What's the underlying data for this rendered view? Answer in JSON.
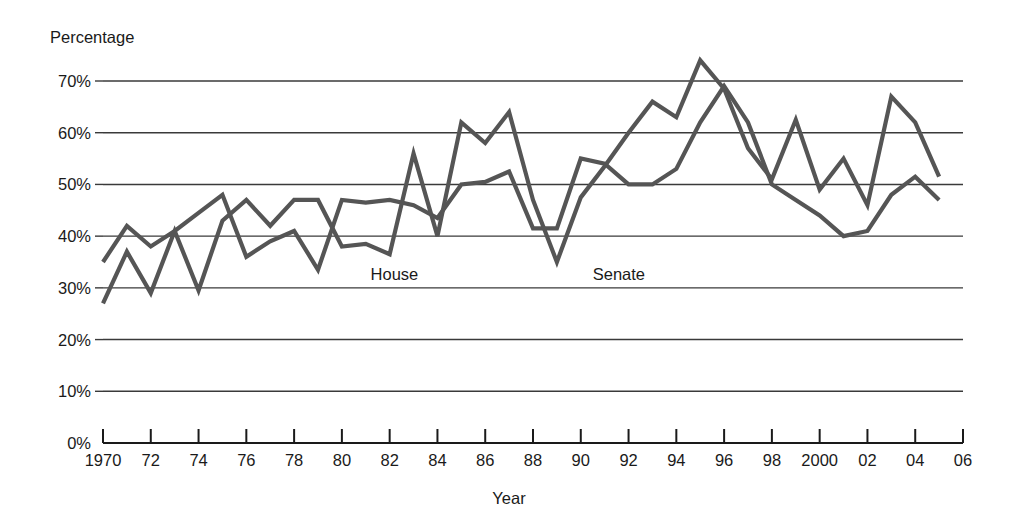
{
  "chart_data": {
    "type": "line",
    "title": "",
    "ylabel": "Percentage",
    "xlabel": "Year",
    "ylim": [
      0,
      75
    ],
    "xlim": [
      1970,
      2006
    ],
    "grid": true,
    "legend_position": "inline-annotations",
    "y_ticks": [
      "0%",
      "10%",
      "20%",
      "30%",
      "40%",
      "50%",
      "60%",
      "70%"
    ],
    "y_tick_values": [
      0,
      10,
      20,
      30,
      40,
      50,
      60,
      70
    ],
    "x_ticks": [
      "1970",
      "72",
      "74",
      "76",
      "78",
      "80",
      "82",
      "84",
      "86",
      "88",
      "90",
      "92",
      "94",
      "96",
      "98",
      "2000",
      "02",
      "04",
      "06"
    ],
    "x_tick_values": [
      1970,
      1972,
      1974,
      1976,
      1978,
      1980,
      1982,
      1984,
      1986,
      1988,
      1990,
      1992,
      1994,
      1996,
      1998,
      2000,
      2002,
      2004,
      2006
    ],
    "x": [
      1970,
      1971,
      1972,
      1973,
      1974,
      1975,
      1976,
      1977,
      1978,
      1979,
      1980,
      1981,
      1982,
      1983,
      1984,
      1985,
      1986,
      1987,
      1988,
      1989,
      1990,
      1991,
      1992,
      1993,
      1994,
      1995,
      1996,
      1997,
      1998,
      1999,
      2000,
      2001,
      2002,
      2003,
      2004,
      2005
    ],
    "series": [
      {
        "name": "House",
        "color": "#555555",
        "label_x": 1981.2,
        "label_y": 31.5,
        "values": [
          35,
          42,
          38,
          41,
          44.5,
          48,
          36,
          39,
          41,
          33.5,
          47,
          46.5,
          47,
          46,
          43.5,
          50,
          50.5,
          52.5,
          41.5,
          41.5,
          55,
          54,
          50,
          50,
          53,
          62,
          69,
          62,
          50,
          47,
          44,
          40,
          41,
          48,
          51.5,
          47
        ]
      },
      {
        "name": "Senate",
        "color": "#555555",
        "label_x": 1990.5,
        "label_y": 31.5,
        "values": [
          27,
          37,
          29,
          41,
          29.5,
          43,
          47,
          42,
          47,
          47,
          38,
          38.5,
          36.5,
          56,
          40,
          62,
          58,
          64,
          47,
          35,
          47.5,
          53.5,
          60,
          66,
          63,
          74,
          68.5,
          57,
          51,
          62.5,
          49,
          55,
          46,
          67,
          62,
          51.5
        ]
      }
    ]
  },
  "axis": {
    "y_title": "Percentage",
    "x_title": "Year"
  }
}
